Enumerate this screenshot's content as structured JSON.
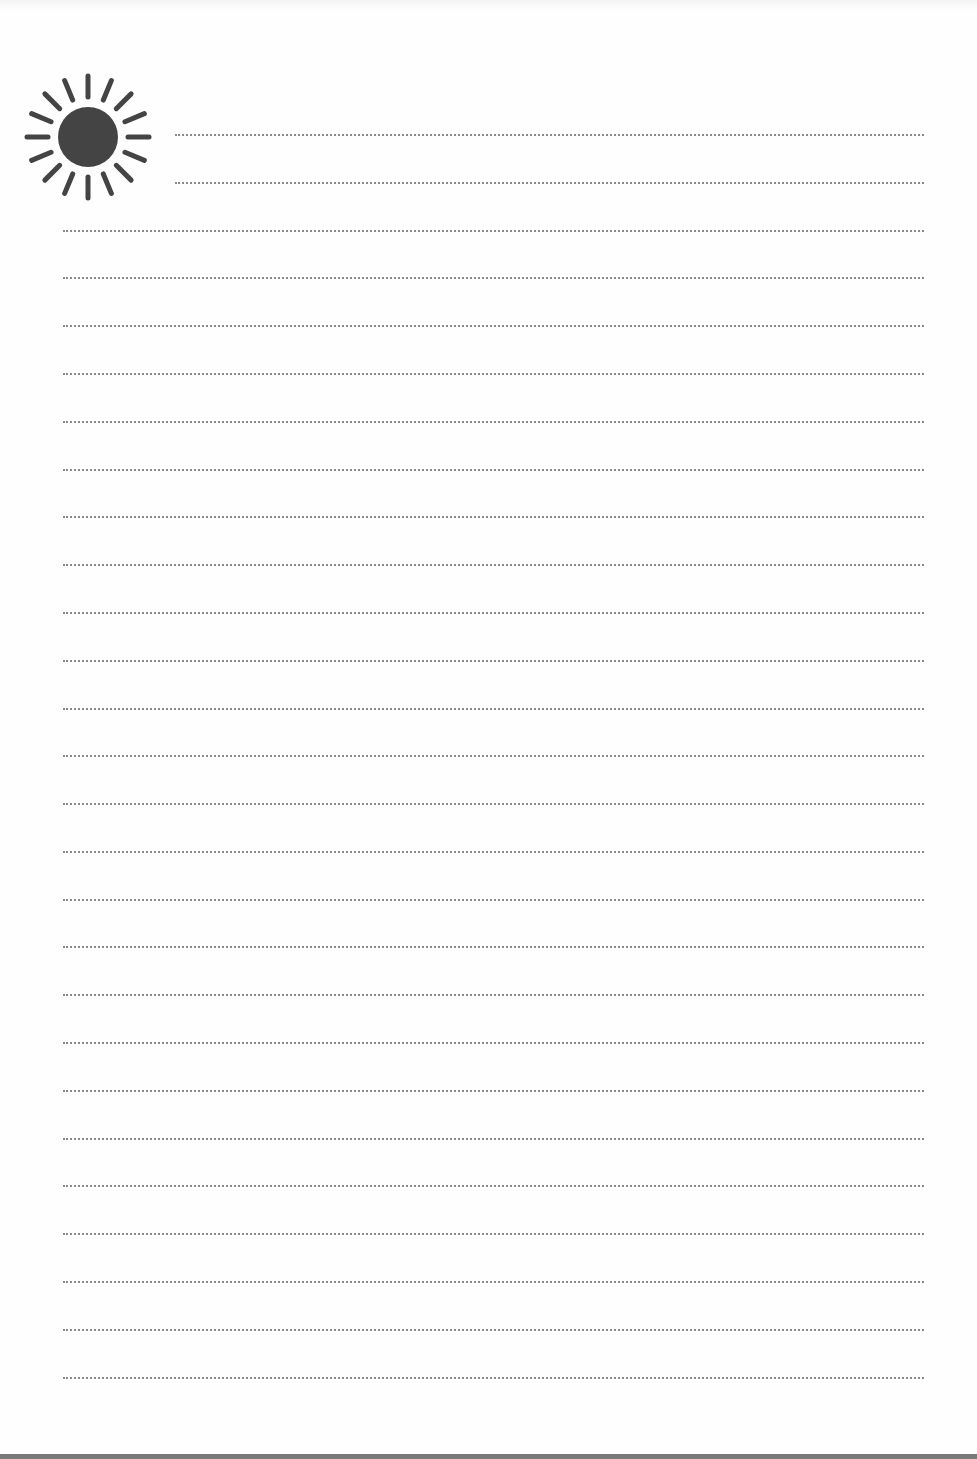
{
  "page": {
    "type": "lined-notepaper",
    "colors": {
      "background": "#fefefe",
      "icon": "#444444",
      "rule": "#8a8a8a",
      "bottom_edge": "#7a7a7a"
    }
  },
  "header_icon": {
    "name": "sun-icon",
    "rays": 16
  },
  "rules": {
    "short_lines": [
      {
        "y": 134,
        "x_start": 175,
        "x_end": 924
      },
      {
        "y": 182,
        "x_start": 175,
        "x_end": 924
      }
    ],
    "full_lines": {
      "x_start": 63,
      "x_end": 924,
      "y_positions": [
        230,
        277,
        325,
        373,
        421,
        469,
        516,
        564,
        612,
        660,
        708,
        755,
        803,
        851,
        899,
        946,
        994,
        1042,
        1090,
        1138,
        1185,
        1233,
        1281,
        1329,
        1377
      ]
    }
  }
}
